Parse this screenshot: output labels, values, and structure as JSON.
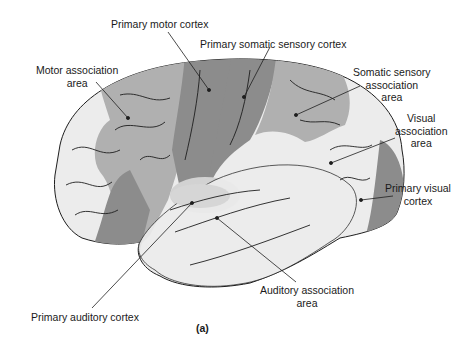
{
  "figure": {
    "caption": "(a)",
    "colors": {
      "primary_area": "#8c8c8c",
      "association_area": "#b0b0b0",
      "unshaded_cortex": "#ececec",
      "highlight_auditory": "#d2d2d2",
      "outline": "#1e1e1e",
      "text": "#1a1a1a"
    }
  },
  "labels": {
    "primary_motor_cortex": "Primary motor cortex",
    "primary_somatic_sensory_cortex": "Primary somatic sensory cortex",
    "motor_association_area": {
      "line1": "Motor association",
      "line2": "area"
    },
    "somatic_sensory_association_area": {
      "line1": "Somatic sensory",
      "line2": "association",
      "line3": "area"
    },
    "visual_association_area": {
      "line1": "Visual",
      "line2": "association",
      "line3": "area"
    },
    "primary_visual_cortex": {
      "line1": "Primary visual",
      "line2": "cortex"
    },
    "auditory_association_area": {
      "line1": "Auditory association",
      "line2": "area"
    },
    "primary_auditory_cortex": "Primary auditory cortex"
  }
}
